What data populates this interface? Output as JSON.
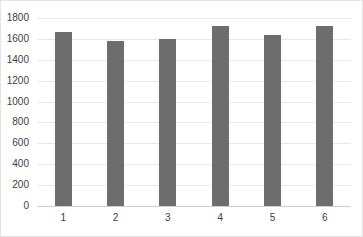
{
  "chart_data": {
    "type": "bar",
    "title": "",
    "subtitle": "",
    "xlabel": "",
    "ylabel": "",
    "categories": [
      "1",
      "2",
      "3",
      "4",
      "5",
      "6"
    ],
    "values": [
      1670,
      1580,
      1600,
      1725,
      1635,
      1720
    ],
    "series": [
      {
        "name": "Series 1",
        "values": [
          1670,
          1580,
          1600,
          1725,
          1635,
          1720
        ],
        "color": "#6d6d6d"
      }
    ],
    "ylim": [
      0,
      1800
    ],
    "ytick_step": 200,
    "ytick_labels": [
      "0",
      "200",
      "400",
      "600",
      "800",
      "1000",
      "1200",
      "1400",
      "1600",
      "1800"
    ],
    "ytick_values": [
      0,
      200,
      400,
      600,
      800,
      1000,
      1200,
      1400,
      1600,
      1800
    ],
    "grid": true,
    "grid_axis": "y",
    "grid_color": "#e8e8e8",
    "legend": false,
    "legend_position": "none",
    "annotations": [],
    "data_labels": false,
    "bar_color": "#6d6d6d",
    "background_color": "#ffffff",
    "border_color": "#e4e4e4",
    "axis_text_color": "#3d3d3d"
  }
}
